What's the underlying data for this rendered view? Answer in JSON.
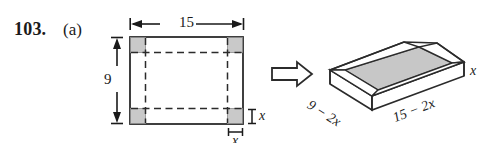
{
  "problem": {
    "number": "103.",
    "part": "(a)"
  },
  "flat_figure": {
    "name": "rectangular-sheet-with-corner-cutouts",
    "width_label": "15",
    "height_label": "9",
    "corner_height_label": "x",
    "corner_width_label": "x",
    "corner_count": 4,
    "corner_fill": "#c9c9c9",
    "outline_color": "#2b2b2b",
    "fold_line_style": "dashed"
  },
  "transform_arrow": {
    "name": "right-block-arrow",
    "direction": "right"
  },
  "box_figure": {
    "name": "open-top-rectangular-box",
    "length_label": "15 − 2x",
    "width_label": "9 − 2x",
    "height_label": "x",
    "base_fill": "#c7c7c7",
    "face_fill": "#ffffff",
    "outline_color": "#2b2b2b"
  },
  "colors": {
    "background": "#ffffff",
    "ink": "#1a1a1a",
    "shade": "#c9c9c9"
  }
}
